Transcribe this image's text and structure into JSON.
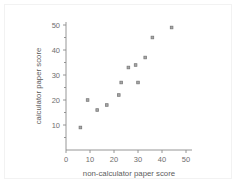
{
  "chart_data": {
    "type": "scatter",
    "title": "",
    "subtitle": "",
    "xlabel": "non-calculator paper score",
    "ylabel": "calculator paper score",
    "xlim": [
      0,
      52
    ],
    "ylim": [
      0,
      52
    ],
    "xticks": [
      0,
      10,
      20,
      30,
      40,
      50
    ],
    "yticks": [
      0,
      10,
      20,
      30,
      40,
      50
    ],
    "xtick_labels": [
      "0",
      "10",
      "20",
      "30",
      "40",
      "50"
    ],
    "ytick_labels": [
      "0",
      "10",
      "20",
      "30",
      "40",
      "50"
    ],
    "grid": false,
    "legend": null,
    "legend_position": "none",
    "marker_style": "small-square",
    "marker_color": "#a8a8a8",
    "axis_color": "#8a8a8a",
    "series": [
      {
        "name": "students",
        "x": [
          6,
          9,
          13,
          17,
          22,
          23,
          26,
          29,
          30,
          33,
          36,
          44
        ],
        "y": [
          9,
          20,
          16,
          18,
          22,
          27,
          33,
          34,
          27,
          37,
          45,
          49
        ]
      }
    ],
    "points": [
      {
        "x": 6,
        "y": 9
      },
      {
        "x": 9,
        "y": 20
      },
      {
        "x": 13,
        "y": 16
      },
      {
        "x": 17,
        "y": 18
      },
      {
        "x": 22,
        "y": 22
      },
      {
        "x": 23,
        "y": 27
      },
      {
        "x": 26,
        "y": 33
      },
      {
        "x": 29,
        "y": 34
      },
      {
        "x": 30,
        "y": 27
      },
      {
        "x": 33,
        "y": 37
      },
      {
        "x": 36,
        "y": 45
      },
      {
        "x": 44,
        "y": 49
      }
    ]
  },
  "axes": {
    "x_title": "non-calculator paper score",
    "y_title": "calculator paper score"
  },
  "colors": {
    "axis": "#8a8a8a",
    "tick_text": "#6e6e6e",
    "title_text": "#5c5c5c",
    "marker_fill": "#a8a8a8",
    "marker_stroke": "#7a7a7a",
    "background": "#ffffff",
    "frame": "#f2f2f2"
  }
}
